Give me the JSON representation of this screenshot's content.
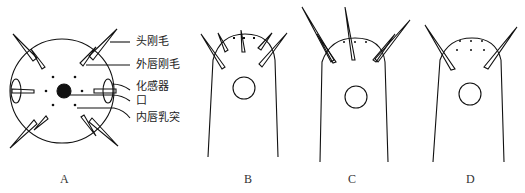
{
  "figure": {
    "panels": [
      {
        "id": "A",
        "label": "A",
        "view": "en face head view"
      },
      {
        "id": "B",
        "label": "B",
        "view": "lateral head view"
      },
      {
        "id": "C",
        "label": "C",
        "view": "lateral head view"
      },
      {
        "id": "D",
        "label": "D",
        "view": "lateral head view"
      }
    ],
    "annotations": [
      {
        "text": "头刚毛"
      },
      {
        "text": "外唇刚毛"
      },
      {
        "text": "化感器"
      },
      {
        "text": "口"
      },
      {
        "text": "内唇乳突"
      }
    ]
  }
}
